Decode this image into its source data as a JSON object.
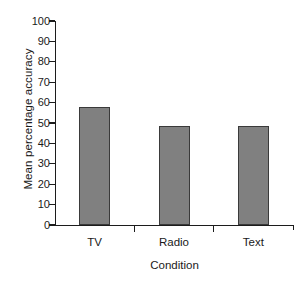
{
  "chart_data": {
    "type": "bar",
    "title": "",
    "categories": [
      "TV",
      "Radio",
      "Text"
    ],
    "values": [
      58,
      48.5,
      48.5
    ],
    "series": [
      {
        "name": "Mean percentage accuracy",
        "values": [
          58,
          48.5,
          48.5
        ]
      }
    ],
    "xlabel": "Condition",
    "ylabel": "Mean percentage accuracy",
    "ylim": [
      0,
      100
    ],
    "ytick_labels": [
      "0",
      "10",
      "20",
      "30",
      "40",
      "50",
      "60",
      "70",
      "80",
      "90",
      "100"
    ],
    "ytick_values": [
      0,
      10,
      20,
      30,
      40,
      50,
      60,
      70,
      80,
      90,
      100
    ],
    "grid": false,
    "legend": false,
    "legend_position": "none",
    "bar_color": "#808080",
    "bar_edge_color": "#3a3a3a",
    "axis_color": "#1c1c1c",
    "background_color": "#ffffff"
  }
}
